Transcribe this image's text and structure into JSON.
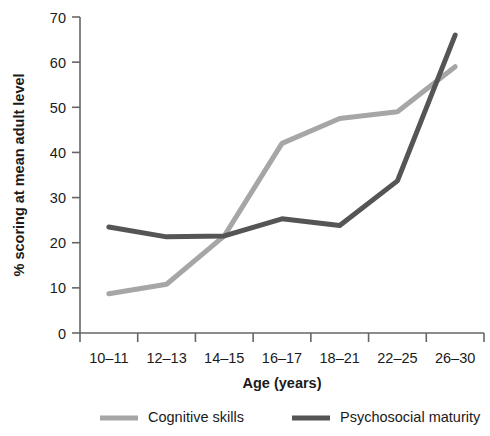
{
  "chart_data": {
    "type": "line",
    "title": "",
    "xlabel": "Age (years)",
    "ylabel": "% scoring at mean adult level",
    "categories": [
      "10–11",
      "12–13",
      "14–15",
      "16–17",
      "18–21",
      "22–25",
      "26–30"
    ],
    "ylim": [
      0,
      70
    ],
    "yticks": [
      0,
      10,
      20,
      30,
      40,
      50,
      60,
      70
    ],
    "ytick_labels": [
      "0",
      "10",
      "20",
      "30",
      "40",
      "50",
      "60",
      "70"
    ],
    "grid": false,
    "legend_position": "bottom",
    "series": [
      {
        "name": "Cognitive skills",
        "color": "#a6a6a6",
        "values": [
          8.7,
          10.8,
          21.5,
          42.0,
          47.5,
          49.0,
          59.0
        ]
      },
      {
        "name": "Psychosocial maturity",
        "color": "#555555",
        "values": [
          23.5,
          21.3,
          21.5,
          25.3,
          23.8,
          33.7,
          66.0
        ]
      }
    ]
  },
  "axis": {
    "x_label": "Age (years)",
    "y_label": "% scoring at mean adult level"
  },
  "legend": {
    "items": [
      {
        "label": "Cognitive skills",
        "color": "#a6a6a6"
      },
      {
        "label": "Psychosocial maturity",
        "color": "#555555"
      }
    ]
  },
  "xtick_labels": [
    "10–11",
    "12–13",
    "14–15",
    "16–17",
    "18–21",
    "22–25",
    "26–30"
  ],
  "ytick_labels": [
    "0",
    "10",
    "20",
    "30",
    "40",
    "50",
    "60",
    "70"
  ]
}
